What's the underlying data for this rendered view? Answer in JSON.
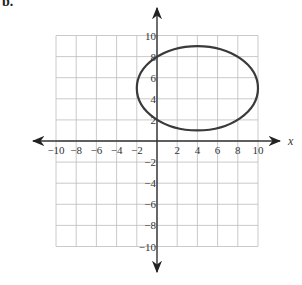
{
  "part_label": "b.",
  "chart_data": {
    "type": "line",
    "title": "",
    "xlabel": "x",
    "ylabel": "",
    "xlim": [
      -10,
      10
    ],
    "ylim": [
      -10,
      10
    ],
    "grid": true,
    "grid_step": 2,
    "x_ticks": [
      -10,
      -8,
      -6,
      -4,
      -2,
      2,
      4,
      6,
      8,
      10
    ],
    "y_ticks": [
      10,
      8,
      6,
      4,
      2,
      -2,
      -4,
      -6,
      -8,
      -10
    ],
    "series": [
      {
        "name": "ellipse",
        "shape": "ellipse",
        "center": [
          4,
          5
        ],
        "semi_axis_x": 6,
        "semi_axis_y": 4,
        "equation": "(x-4)^2/36 + (y-5)^2/16 = 1",
        "key_points": [
          [
            4,
            9
          ],
          [
            4,
            1
          ],
          [
            10,
            5
          ],
          [
            -2,
            5
          ],
          [
            0,
            8
          ],
          [
            0,
            2
          ]
        ]
      }
    ]
  },
  "colors": {
    "grid": "#bdbdbd",
    "axis": "#333333",
    "curve": "#3a3a3a"
  }
}
